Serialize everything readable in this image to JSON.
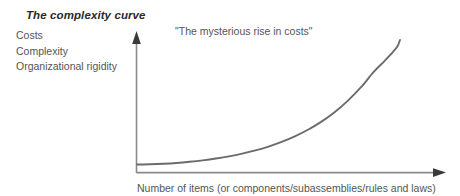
{
  "figure": {
    "title": "The complexity curve",
    "annotation": "\"The mysterious rise in costs\"",
    "y_axis_labels": [
      "Costs",
      "Complexity",
      "Organizational rigidity"
    ],
    "x_axis_label": "Number of items (or components/subassemblies/rules and laws)",
    "colors": {
      "curve": "#6b6b6b",
      "axis": "#8a8a8a",
      "title_text": "#2a2a2a",
      "body_text": "#555555",
      "background": "#ffffff"
    }
  },
  "chart_data": {
    "type": "line",
    "title": "The complexity curve",
    "xlabel": "Number of items (or components/subassemblies/rules and laws)",
    "ylabel": "Costs / Complexity / Organizational rigidity",
    "ylabel_lines": [
      "Costs",
      "Complexity",
      "Organizational rigidity"
    ],
    "annotations": [
      "\"The mysterious rise in costs\""
    ],
    "grid": false,
    "legend": null,
    "axis_ticks": false,
    "axis_arrows": {
      "x": "right",
      "y": "up"
    },
    "xlim": [
      0,
      100
    ],
    "ylim": [
      0,
      100
    ],
    "series": [
      {
        "name": "Complexity cost curve",
        "x": [
          0,
          5,
          10,
          15,
          20,
          25,
          30,
          35,
          40,
          45,
          50,
          55,
          60,
          65,
          70,
          75,
          80,
          85,
          90,
          94,
          97,
          99,
          100
        ],
        "y": [
          3.5,
          3.7,
          4.1,
          4.7,
          5.6,
          6.7,
          8.1,
          9.8,
          11.9,
          14.4,
          17.4,
          21.0,
          25.3,
          30.4,
          36.5,
          43.8,
          52.6,
          63.0,
          75.2,
          83.5,
          90.0,
          95.0,
          100
        ]
      }
    ]
  }
}
